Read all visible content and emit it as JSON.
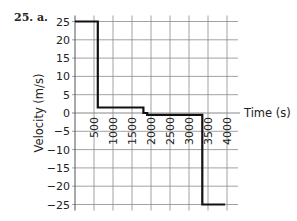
{
  "problem": {
    "label": "25. a."
  },
  "chart_data": {
    "type": "line",
    "style": "step",
    "title": "",
    "xlabel": "Time (s)",
    "ylabel": "Velocity (m/s)",
    "xlim": [
      0,
      4300
    ],
    "ylim": [
      -25,
      25
    ],
    "grid": true,
    "x_ticks": [
      500,
      1000,
      1500,
      2000,
      2500,
      3000,
      3500,
      4000
    ],
    "x_tick_labels": [
      "500",
      "1000",
      "1500",
      "2000",
      "2500",
      "3000",
      "3500",
      "4000"
    ],
    "y_ticks": [
      25,
      20,
      15,
      10,
      5,
      0,
      -5,
      -10,
      -15,
      -20,
      -25
    ],
    "y_tick_labels": [
      "25",
      "20",
      "15",
      "10",
      "5",
      "0",
      "−5",
      "−10",
      "−15",
      "−20",
      "−25"
    ],
    "series": [
      {
        "name": "velocity",
        "color": "#111111",
        "points": [
          [
            0,
            25
          ],
          [
            600,
            25
          ],
          [
            600,
            1.5
          ],
          [
            1800,
            1.5
          ],
          [
            1800,
            0
          ],
          [
            1900,
            0
          ],
          [
            1900,
            -0.5
          ],
          [
            3350,
            -0.5
          ],
          [
            3350,
            -25
          ],
          [
            3950,
            -25
          ]
        ]
      }
    ]
  },
  "colors": {
    "grid": "#8a8a8a",
    "line": "#111111",
    "text": "#222222"
  }
}
